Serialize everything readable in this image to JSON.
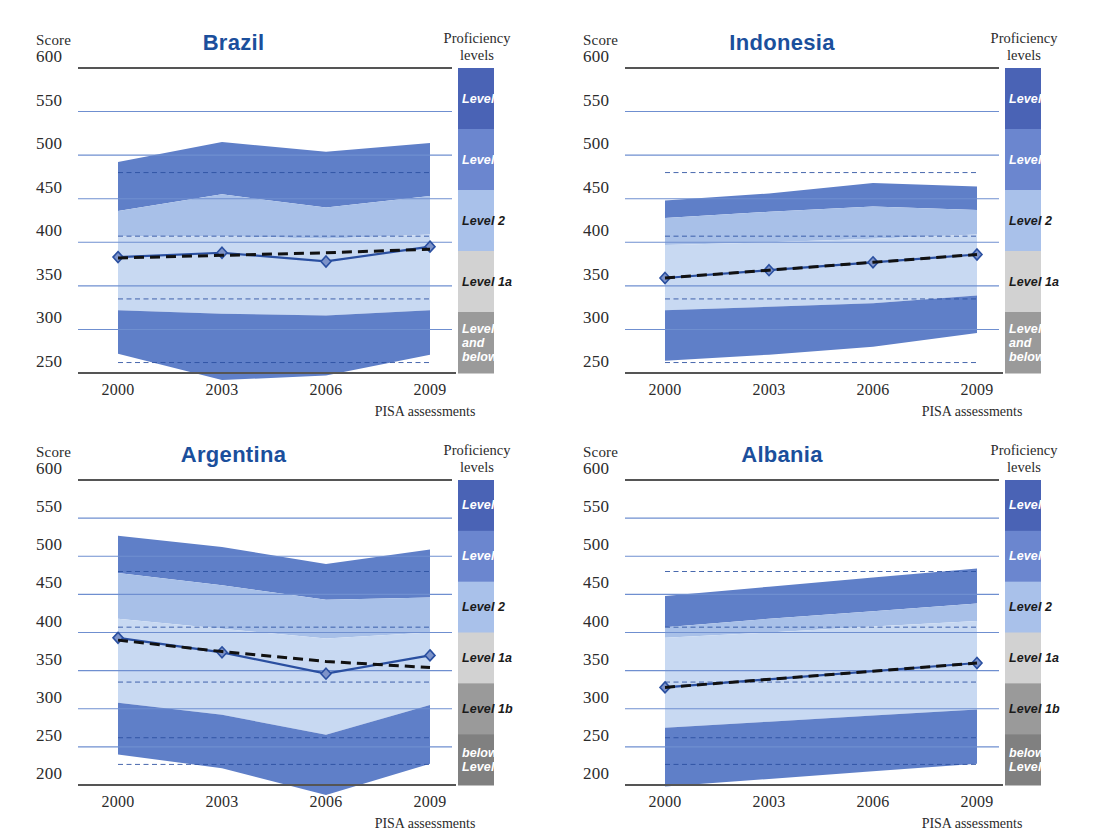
{
  "figure": {
    "score_label": "Score",
    "xaxis_title": "PISA assessments",
    "proficiency_title_line1": "Proficiency",
    "proficiency_title_line2": "levels"
  },
  "colors": {
    "title_blue": "#1b4f9c",
    "band_level3": "#5f7fc8",
    "band_level2": "#a8c0e8",
    "band_level1a": "#c8d9f2",
    "band_level1b": "#5f7fc8",
    "legend_level4": "#4a63b5",
    "legend_level3": "#6b86cf",
    "legend_level2": "#a9c1ea",
    "legend_level1a": "#d2d2d2",
    "legend_level1b": "#9a9a9a",
    "legend_below": "#808080",
    "gridline": "#6f8fd0",
    "axis": "#555555",
    "series_line": "#2a4fa0",
    "trend_line": "#111111"
  },
  "chart_data": [
    {
      "type": "area",
      "title": "Brazil",
      "xlabel": "PISA assessments",
      "ylabel": "Score",
      "x": [
        "2000",
        "2003",
        "2006",
        "2009"
      ],
      "ylim": [
        250,
        600
      ],
      "yticks": [
        600,
        550,
        500,
        450,
        400,
        350,
        300,
        250
      ],
      "grid": true,
      "legend_position": "right",
      "series": [
        {
          "name": "Mean score",
          "values": [
            383,
            388,
            378,
            395
          ],
          "style": "solid-marker"
        },
        {
          "name": "Trend",
          "values": [
            382,
            385,
            388,
            392
          ],
          "style": "dashed"
        }
      ],
      "bands": {
        "top": [
          492,
          515,
          504,
          514
        ],
        "level3_level2_boundary": [
          436,
          455,
          440,
          453
        ],
        "level2_level1a_boundary": [
          407,
          407,
          404,
          409
        ],
        "level1a_level1b_boundary": [
          322,
          318,
          316,
          322
        ],
        "bottom": [
          272,
          242,
          247,
          271
        ]
      },
      "level_thresholds": [
        480,
        407,
        335,
        262
      ]
    },
    {
      "type": "area",
      "title": "Indonesia",
      "xlabel": "PISA assessments",
      "ylabel": "Score",
      "x": [
        "2000",
        "2003",
        "2006",
        "2009"
      ],
      "ylim": [
        250,
        600
      ],
      "yticks": [
        600,
        550,
        500,
        450,
        400,
        350,
        300,
        250
      ],
      "grid": true,
      "legend_position": "right",
      "series": [
        {
          "name": "Mean score",
          "values": [
            359,
            368,
            377,
            386
          ],
          "style": "solid-marker"
        },
        {
          "name": "Trend",
          "values": [
            359,
            368,
            377,
            386
          ],
          "style": "dashed"
        }
      ],
      "bands": {
        "top": [
          448,
          456,
          468,
          464
        ],
        "level3_level2_boundary": [
          428,
          435,
          441,
          437
        ],
        "level2_level1a_boundary": [
          397,
          400,
          404,
          409
        ],
        "level1a_level1b_boundary": [
          322,
          326,
          330,
          339
        ],
        "bottom": [
          264,
          271,
          280,
          296
        ]
      },
      "level_thresholds": [
        480,
        407,
        335,
        262
      ]
    },
    {
      "type": "area",
      "title": "Argentina",
      "xlabel": "PISA assessments",
      "ylabel": "Score",
      "x": [
        "2000",
        "2003",
        "2006",
        "2009"
      ],
      "ylim": [
        200,
        600
      ],
      "yticks": [
        600,
        550,
        500,
        450,
        400,
        350,
        300,
        250,
        200
      ],
      "grid": true,
      "legend_position": "right",
      "series": [
        {
          "name": "Mean score",
          "values": [
            393,
            374,
            346,
            370
          ],
          "style": "solid-marker"
        },
        {
          "name": "Trend",
          "values": [
            390,
            375,
            362,
            354
          ],
          "style": "dashed"
        }
      ],
      "bands": {
        "top": [
          527,
          512,
          490,
          509
        ],
        "level3_level2_boundary": [
          478,
          462,
          443,
          446
        ],
        "level2_level1a_boundary": [
          418,
          405,
          392,
          400
        ],
        "level1a_level1b_boundary": [
          308,
          292,
          266,
          305
        ],
        "bottom": [
          240,
          222,
          187,
          228
        ]
      },
      "level_thresholds": [
        480,
        407,
        335,
        262,
        227
      ]
    },
    {
      "type": "area",
      "title": "Albania",
      "xlabel": "PISA assessments",
      "ylabel": "Score",
      "x": [
        "2000",
        "2003",
        "2006",
        "2009"
      ],
      "ylim": [
        200,
        600
      ],
      "yticks": [
        600,
        550,
        500,
        450,
        400,
        350,
        300,
        250,
        200
      ],
      "grid": true,
      "legend_position": "right",
      "series": [
        {
          "name": "Mean score",
          "values": [
            328,
            null,
            null,
            360
          ],
          "style": "solid-marker"
        },
        {
          "name": "Trend",
          "values": [
            328,
            null,
            null,
            360
          ],
          "style": "dashed"
        }
      ],
      "bands": {
        "top": [
          448,
          460,
          472,
          484
        ],
        "level3_level2_boundary": [
          407,
          418,
          428,
          438
        ],
        "level2_level1a_boundary": [
          393,
          400,
          408,
          415
        ],
        "level1a_level1b_boundary": [
          275,
          283,
          291,
          299
        ],
        "bottom": [
          198,
          208,
          218,
          228
        ]
      },
      "level_thresholds": [
        480,
        407,
        335,
        262,
        227
      ]
    }
  ],
  "legend_5band": [
    {
      "label": "Level 4",
      "color": "#4a63b5",
      "text_color": "#ffffff"
    },
    {
      "label": "Level 3",
      "color": "#6b86cf",
      "text_color": "#ffffff"
    },
    {
      "label": "Level 2",
      "color": "#a9c1ea",
      "text_color": "#1a1a1a"
    },
    {
      "label": "Level 1a",
      "color": "#d2d2d2",
      "text_color": "#1a1a1a"
    },
    {
      "label": "Level 1b and below",
      "color": "#9a9a9a",
      "text_color": "#ffffff"
    }
  ],
  "legend_6band": [
    {
      "label": "Level 4",
      "color": "#4a63b5",
      "text_color": "#ffffff"
    },
    {
      "label": "Level 3",
      "color": "#6b86cf",
      "text_color": "#ffffff"
    },
    {
      "label": "Level 2",
      "color": "#a9c1ea",
      "text_color": "#1a1a1a"
    },
    {
      "label": "Level 1a",
      "color": "#d2d2d2",
      "text_color": "#1a1a1a"
    },
    {
      "label": "Level 1b",
      "color": "#9a9a9a",
      "text_color": "#1a1a1a"
    },
    {
      "label": "below Level 1b",
      "color": "#808080",
      "text_color": "#ffffff"
    }
  ]
}
